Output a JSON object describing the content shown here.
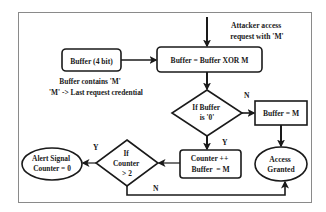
{
  "diagram": {
    "type": "flowchart",
    "input_annotation": {
      "lines": [
        "Attacker access",
        "request with 'M'"
      ]
    },
    "nodes": {
      "buffer_store": {
        "shape": "rounded-rect",
        "label": "Buffer (4 bit)"
      },
      "xor_step": {
        "shape": "rounded-rect",
        "label": "Buffer = Buffer XOR M"
      },
      "buffer_zero_check": {
        "shape": "diamond",
        "lines": [
          "If Buffer",
          "is '0'"
        ]
      },
      "buffer_set": {
        "shape": "rect",
        "label": "Buffer = M"
      },
      "access_granted": {
        "shape": "ellipse",
        "lines": [
          "Access",
          "Granted"
        ]
      },
      "counter_update": {
        "shape": "rounded-rect",
        "lines": [
          "Counter ++",
          "Buffer  = M"
        ]
      },
      "counter_check": {
        "shape": "diamond",
        "lines": [
          "If",
          "Counter",
          "> 2"
        ]
      },
      "alert": {
        "shape": "ellipse",
        "lines": [
          "Alert Signal",
          "Counter = 0"
        ]
      }
    },
    "buffer_note": {
      "lines": [
        "Buffer  contains 'M'",
        "'M' -> Last request credential"
      ]
    },
    "edge_labels": {
      "zero_no": "N",
      "zero_yes": "Y",
      "counter_yes": "Y",
      "counter_no": "N"
    },
    "colors": {
      "stroke": "#1a1a1a",
      "frame": "#8a8a8a",
      "background": "#ffffff"
    }
  }
}
